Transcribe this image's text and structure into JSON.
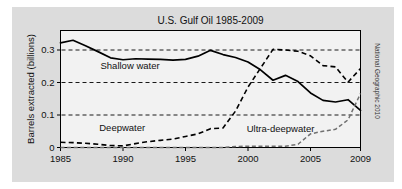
{
  "figure": {
    "background_color": "#dcdcdc",
    "plot_background_color": "#f2f2f2",
    "page_background_color": "#ffffff",
    "credit": "National Geographic 2010"
  },
  "chart_data": {
    "type": "line",
    "title": "U.S. Gulf Oil 1985-2009",
    "xlabel": "",
    "ylabel": "Barrels extracted (billions)",
    "xlim": [
      1985,
      2009
    ],
    "ylim": [
      0,
      0.36
    ],
    "xticks": [
      1985,
      1990,
      1995,
      2000,
      2005,
      2009
    ],
    "xtick_labels": [
      "1985",
      "1990",
      "1995",
      "2000",
      "2005",
      "2009"
    ],
    "yticks": [
      0,
      0.1,
      0.2,
      0.3
    ],
    "ytick_labels": [
      "0",
      "0.1",
      "0.2",
      "0.3"
    ],
    "grid": "horizontal-dashed",
    "legend": "inline-annotations",
    "x": [
      1985,
      1986,
      1987,
      1988,
      1989,
      1990,
      1991,
      1992,
      1993,
      1994,
      1995,
      1996,
      1997,
      1998,
      1999,
      2000,
      2001,
      2002,
      2003,
      2004,
      2005,
      2006,
      2007,
      2008,
      2009
    ],
    "series": [
      {
        "name": "Shallow water",
        "style": "solid",
        "color": "#000000",
        "label_x": 1988.2,
        "label_y": 0.243,
        "values": [
          0.322,
          0.33,
          0.313,
          0.295,
          0.276,
          0.27,
          0.273,
          0.272,
          0.271,
          0.269,
          0.271,
          0.281,
          0.299,
          0.286,
          0.277,
          0.263,
          0.239,
          0.207,
          0.222,
          0.203,
          0.168,
          0.145,
          0.14,
          0.147,
          0.114
        ]
      },
      {
        "name": "Deepwater",
        "style": "dashed",
        "color": "#000000",
        "label_x": 1988.1,
        "label_y": 0.052,
        "values": [
          0.016,
          0.015,
          0.013,
          0.01,
          0.006,
          0.005,
          0.012,
          0.018,
          0.022,
          0.026,
          0.034,
          0.042,
          0.058,
          0.06,
          0.112,
          0.186,
          0.244,
          0.302,
          0.3,
          0.296,
          0.282,
          0.252,
          0.248,
          0.201,
          0.243
        ]
      },
      {
        "name": "Ultra-deepwater",
        "style": "dashed-gray",
        "color": "#707070",
        "label_x": 1999.9,
        "label_y": 0.048,
        "values": [
          0.0,
          0.0,
          0.0,
          0.0,
          0.0,
          0.0,
          0.0,
          0.0,
          0.0,
          0.0,
          0.0,
          0.0,
          0.0,
          0.0,
          0.003,
          0.004,
          0.004,
          0.004,
          0.004,
          0.01,
          0.042,
          0.05,
          0.056,
          0.085,
          0.166
        ]
      }
    ]
  }
}
